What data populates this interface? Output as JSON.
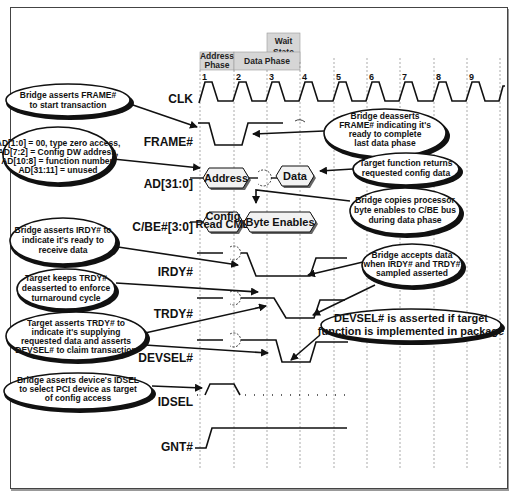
{
  "header": {
    "wait_state_line1": "Wait",
    "wait_state_line2": "State",
    "address_phase_line1": "Address",
    "address_phase_line2": "Phase",
    "data_phase": "Data Phase"
  },
  "clock_numbers": [
    "1",
    "2",
    "3",
    "4",
    "5",
    "6",
    "7",
    "8",
    "9"
  ],
  "signals": {
    "clk": "CLK",
    "frame": "FRAME#",
    "ad": "AD[31:0]",
    "cbe": "C/BE#[3:0]",
    "irdy": "IRDY#",
    "trdy": "TRDY#",
    "devsel": "DEVSEL#",
    "idsel": "IDSEL",
    "gnt": "GNT#"
  },
  "bus_values": {
    "address": "Address",
    "data": "Data",
    "config_cmd_line1": "Config",
    "config_cmd_line2": "Read CMD",
    "byte_enables": "Byte Enables"
  },
  "callouts": {
    "frame_assert": [
      "Bridge asserts FRAME#",
      "to start transaction"
    ],
    "ad_encoding": [
      "AD[1:0] = 00, type zero access,",
      "AD[7:2] = Config DW address,",
      "AD[10:8] = function number,",
      "AD[31:11] = unused"
    ],
    "irdy_assert": [
      "Bridge asserts IRDY# to",
      "indicate it's ready to",
      "receive data"
    ],
    "trdy_deasserted": [
      "Target keeps TRDY#",
      "deasserted to enforce",
      "turnaround cycle"
    ],
    "trdy_assert": [
      "Target asserts TRDY# to",
      "indicate it's supplying",
      "requested data and asserts",
      "DEVSEL# to claim transaction"
    ],
    "idsel_assert": [
      "Bridge asserts device's IDSEL",
      "to select PCI device as target",
      "of config access"
    ],
    "frame_deassert": [
      "Bridge deasserts",
      "FRAME# indicating it's",
      "ready to complete",
      "last data phase"
    ],
    "target_returns": [
      "Target function returns",
      "requested config data"
    ],
    "byte_enables_copy": [
      "Bridge copies processor",
      "byte enables to C/BE bus",
      "during data phase"
    ],
    "bridge_accepts": [
      "Bridge accepts data",
      "when IRDY# and TRDY#",
      "sampled asserted"
    ],
    "devsel_note": [
      "DEVSEL# is asserted if target",
      "function is implemented in package"
    ]
  }
}
